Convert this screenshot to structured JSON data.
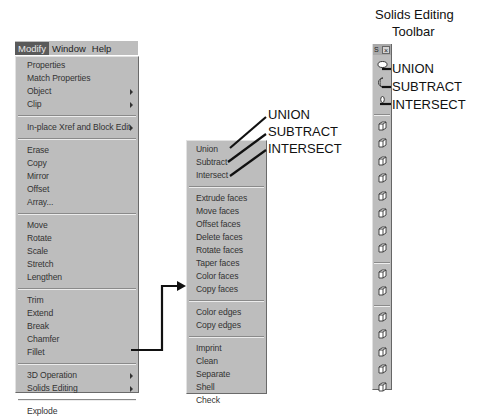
{
  "caption": {
    "title_line1": "Solids Editing",
    "title_line2": "Toolbar"
  },
  "menubar": {
    "items": [
      {
        "label": "Modify",
        "active": true
      },
      {
        "label": "Window",
        "active": false
      },
      {
        "label": "Help",
        "active": false
      }
    ]
  },
  "modify_menu": {
    "groups": [
      [
        {
          "label": "Properties",
          "submenu": false
        },
        {
          "label": "Match Properties",
          "submenu": false
        },
        {
          "label": "Object",
          "submenu": true
        },
        {
          "label": "Clip",
          "submenu": true
        }
      ],
      [
        {
          "label": "In-place Xref and Block Edit",
          "submenu": true
        }
      ],
      [
        {
          "label": "Erase",
          "submenu": false
        },
        {
          "label": "Copy",
          "submenu": false
        },
        {
          "label": "Mirror",
          "submenu": false
        },
        {
          "label": "Offset",
          "submenu": false
        },
        {
          "label": "Array...",
          "submenu": false
        }
      ],
      [
        {
          "label": "Move",
          "submenu": false
        },
        {
          "label": "Rotate",
          "submenu": false
        },
        {
          "label": "Scale",
          "submenu": false
        },
        {
          "label": "Stretch",
          "submenu": false
        },
        {
          "label": "Lengthen",
          "submenu": false
        }
      ],
      [
        {
          "label": "Trim",
          "submenu": false
        },
        {
          "label": "Extend",
          "submenu": false
        },
        {
          "label": "Break",
          "submenu": false
        },
        {
          "label": "Chamfer",
          "submenu": false
        },
        {
          "label": "Fillet",
          "submenu": false
        }
      ],
      [
        {
          "label": "3D Operation",
          "submenu": true
        },
        {
          "label": "Solids Editing",
          "submenu": true
        }
      ],
      [
        {
          "label": "Explode",
          "submenu": false
        }
      ]
    ]
  },
  "solids_editing_submenu": {
    "groups": [
      [
        "Union",
        "Subtract",
        "Intersect"
      ],
      [
        "Extrude faces",
        "Move faces",
        "Offset faces",
        "Delete faces",
        "Rotate faces",
        "Taper faces",
        "Color faces",
        "Copy faces"
      ],
      [
        "Color edges",
        "Copy edges"
      ],
      [
        "Imprint",
        "Clean",
        "Separate",
        "Shell",
        "Check"
      ]
    ]
  },
  "callouts": {
    "submenu": [
      "UNION",
      "SUBTRACT",
      "INTERSECT"
    ],
    "toolbar": [
      "UNION",
      "SUBTRACT",
      "INTERSECT"
    ]
  },
  "toolbar": {
    "title": "S",
    "close_glyph": "×",
    "buttons": [
      {
        "name": "union-icon",
        "group": 0
      },
      {
        "name": "subtract-icon",
        "group": 0
      },
      {
        "name": "intersect-icon",
        "group": 0
      },
      {
        "name": "extrude-faces-icon",
        "group": 1
      },
      {
        "name": "move-faces-icon",
        "group": 1
      },
      {
        "name": "offset-faces-icon",
        "group": 1
      },
      {
        "name": "delete-faces-icon",
        "group": 1
      },
      {
        "name": "rotate-faces-icon",
        "group": 1
      },
      {
        "name": "taper-faces-icon",
        "group": 1
      },
      {
        "name": "copy-faces-icon",
        "group": 1
      },
      {
        "name": "color-faces-icon",
        "group": 1
      },
      {
        "name": "copy-edges-icon",
        "group": 2
      },
      {
        "name": "color-edges-icon",
        "group": 2
      },
      {
        "name": "imprint-icon",
        "group": 3
      },
      {
        "name": "clean-icon",
        "group": 3
      },
      {
        "name": "separate-icon",
        "group": 3
      },
      {
        "name": "shell-icon",
        "group": 3
      },
      {
        "name": "check-icon",
        "group": 3
      }
    ]
  },
  "colors": {
    "menu_bg": "#bdbdbd",
    "highlight": "#5a5a5a",
    "text": "#333333"
  }
}
